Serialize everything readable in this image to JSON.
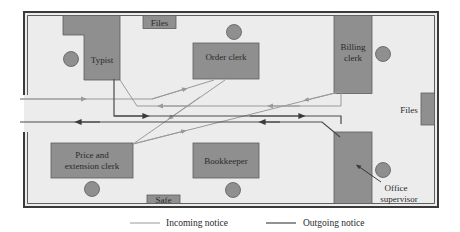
{
  "diagram": {
    "colors": {
      "floor": "#ececec",
      "wall": "#3a3a3a",
      "desk": "#8f8f8f",
      "desk_border": "#5c5c5c",
      "incoming": "#9a9a9a",
      "outgoing": "#4a4a4a"
    },
    "rooms": {
      "typist": "Typist",
      "files_top": "Files",
      "order_clerk": "Order clerk",
      "billing_clerk_line1": "Billing",
      "billing_clerk_line2": "clerk",
      "files_right": "Files",
      "price_clerk_line1": "Price and",
      "price_clerk_line2": "extension clerk",
      "bookkeeper": "Bookkeeper",
      "safe": "Safe",
      "office_supervisor_line1": "Office",
      "office_supervisor_line2": "supervisor"
    },
    "legend": {
      "incoming": "Incoming notice",
      "outgoing": "Outgoing notice"
    }
  }
}
